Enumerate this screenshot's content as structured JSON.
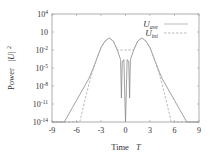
{
  "chart_data": {
    "type": "line",
    "title": "",
    "xlabel": "Time  T",
    "ylabel": "Power  |U|²",
    "xlim": [
      -9,
      9
    ],
    "ylim_log10": [
      -14,
      4
    ],
    "yscale": "log",
    "grid": false,
    "legend_position": "upper right",
    "x_ticks": [
      -9,
      -6,
      -3,
      0,
      3,
      6,
      9
    ],
    "y_ticks": [
      {
        "exp": 4,
        "label": "10^4"
      },
      {
        "exp": 1,
        "label": "10"
      },
      {
        "exp": -2,
        "label": "10^-2"
      },
      {
        "exp": -5,
        "label": "10^-5"
      },
      {
        "exp": -8,
        "label": "10^-8"
      },
      {
        "exp": -11,
        "label": "10^-11"
      },
      {
        "exp": -14,
        "label": "10^-14"
      }
    ],
    "series": [
      {
        "name": "U_ave",
        "style": "solid",
        "color": "#888888",
        "description": "Two symmetric lobes peaking ~1 near T=±2, deep notches near T=±0.5 and T=0, oscillating tails decaying to 1e-14 near |T|≈7.5",
        "x": [
          -9,
          -7.5,
          -7,
          -6.5,
          -6,
          -5.5,
          -5,
          -4.5,
          -4,
          -3.5,
          -3,
          -2.5,
          -2,
          -1.5,
          -1,
          -0.6,
          -0.5,
          -0.4,
          -0.2,
          0,
          0.2,
          0.4,
          0.5,
          0.6,
          1,
          1.5,
          2,
          2.5,
          3,
          3.5,
          4,
          4.5,
          5,
          5.5,
          6,
          6.5,
          7,
          7.5,
          9
        ],
        "log10y": [
          -14,
          -14,
          -12.8,
          -11.6,
          -10.4,
          -9.2,
          -8,
          -6.8,
          -5.2,
          -3.4,
          -1.6,
          -0.5,
          0,
          -0.5,
          -2,
          -3.6,
          -10,
          -4,
          -3.6,
          -14,
          -3.6,
          -4,
          -10,
          -3.6,
          -2,
          -0.5,
          0,
          -0.5,
          -1.6,
          -3.4,
          -5.2,
          -6.8,
          -8,
          -9.2,
          -10.4,
          -11.6,
          -12.8,
          -14,
          -14
        ]
      },
      {
        "name": "U_ini",
        "style": "dashed",
        "color": "#aaaaaa",
        "description": "Smooth envelope matching U_ave near peaks, decaying faster to 1e-14 at |T|≈5.5",
        "x": [
          -9,
          -5.6,
          -5,
          -4.5,
          -4,
          -3.5,
          -3,
          -2.5,
          -2,
          -1.5,
          -1,
          1,
          1.5,
          2,
          2.5,
          3,
          3.5,
          4,
          4.5,
          5,
          5.6,
          9
        ],
        "log10y": [
          -14,
          -14,
          -10.5,
          -7.8,
          -5.4,
          -3.4,
          -1.6,
          -0.5,
          0,
          -0.5,
          -2,
          -2,
          -0.5,
          0,
          -0.5,
          -1.6,
          -3.4,
          -5.4,
          -7.8,
          -10.5,
          -14,
          -14
        ]
      }
    ]
  },
  "legend": {
    "items": [
      {
        "label": "U",
        "sub": "ave",
        "style": "solid"
      },
      {
        "label": "U",
        "sub": "ini",
        "style": "dashed"
      }
    ]
  },
  "axes": {
    "xlabel_main": "Time",
    "xlabel_var": "T",
    "ylabel_main": "Power",
    "ylabel_var": "|U|",
    "ylabel_sup": "2"
  }
}
